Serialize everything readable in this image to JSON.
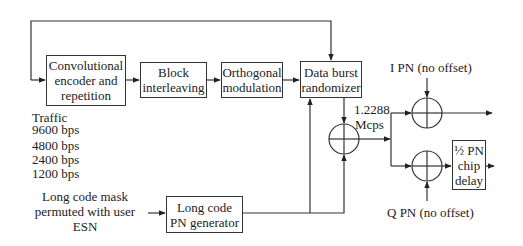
{
  "blocks": {
    "conv_encoder": "Convolutional encoder and repetition",
    "block_interleaving": "Block interleaving",
    "orthogonal_modulation": "Orthogonal modulation",
    "data_burst_randomizer": "Data burst randomizer",
    "long_code_pn_generator": "Long code PN generator",
    "half_pn_chip_delay": "½ PN chip delay"
  },
  "labels": {
    "traffic": "Traffic",
    "rates": [
      "9600 bps",
      "4800 bps",
      "2400 bps",
      "1200 bps"
    ],
    "long_code_mask": "Long code mask permuted with user ESN",
    "chip_rate_value": "1.2288",
    "chip_rate_unit": "Mcps",
    "i_pn": "I PN (no offset)",
    "q_pn": "Q PN (no offset)"
  },
  "symbols": {
    "xor": "modulo-2-adder-icon"
  }
}
